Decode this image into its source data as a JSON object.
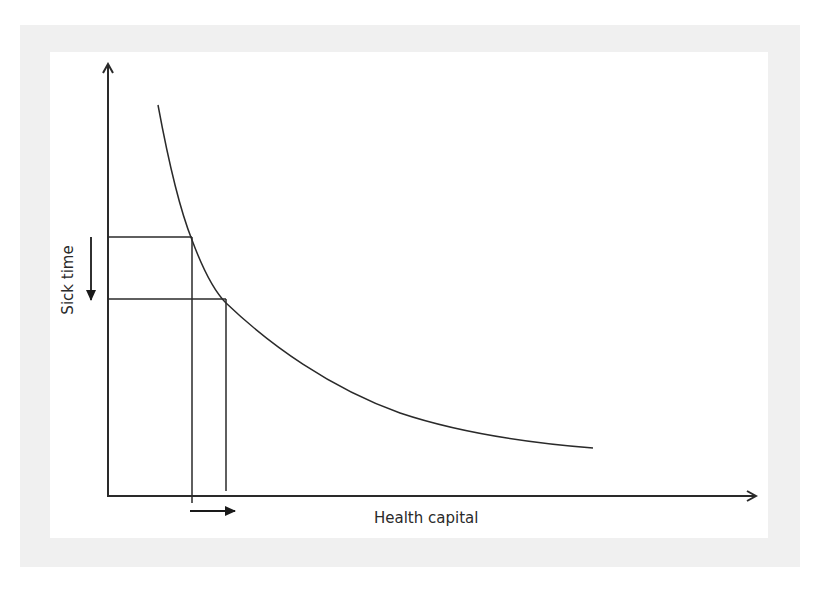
{
  "diagram": {
    "x_axis_label": "Health capital",
    "y_axis_label": "Sick time",
    "caption_partial": "",
    "colors": {
      "frame": "#f0f0f0",
      "background": "#ffffff",
      "stroke": "#2a2a2a"
    },
    "elements": {
      "curve": "downward-sloping convex curve of sick time vs health capital",
      "reference_lines": [
        {
          "name": "level-1",
          "y_level": "higher sick time",
          "x_level": "lower health capital"
        },
        {
          "name": "level-2",
          "y_level": "lower sick time",
          "x_level": "higher health capital"
        }
      ],
      "y_shift_arrow": "down",
      "x_shift_arrow": "right"
    }
  }
}
